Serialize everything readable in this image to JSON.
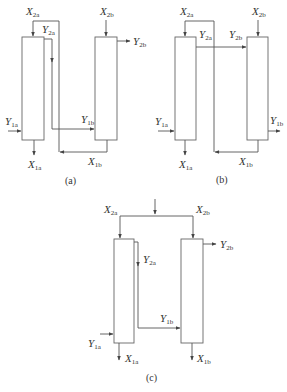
{
  "diagrams": {
    "a": {
      "caption": "(a)",
      "labels": {
        "x2a": {
          "main": "X",
          "sub": "2a"
        },
        "x2b": {
          "main": "X",
          "sub": "2b"
        },
        "y2a": {
          "main": "Y",
          "sub": "2a"
        },
        "y2b": {
          "main": "Y",
          "sub": "2b"
        },
        "y1a": {
          "main": "Y",
          "sub": "1a"
        },
        "y1b": {
          "main": "Y",
          "sub": "1b"
        },
        "x1a": {
          "main": "X",
          "sub": "1a"
        },
        "x1b": {
          "main": "X",
          "sub": "1b"
        }
      }
    },
    "b": {
      "caption": "(b)",
      "labels": {
        "x2a": {
          "main": "X",
          "sub": "2a"
        },
        "x2b": {
          "main": "X",
          "sub": "2b"
        },
        "y2a": {
          "main": "Y",
          "sub": "2a"
        },
        "y2b": {
          "main": "Y",
          "sub": "2b"
        },
        "y1a": {
          "main": "Y",
          "sub": "1a"
        },
        "y1b": {
          "main": "Y",
          "sub": "1b"
        },
        "x1a": {
          "main": "X",
          "sub": "1a"
        },
        "x1b": {
          "main": "X",
          "sub": "1b"
        }
      }
    },
    "c": {
      "caption": "(c)",
      "labels": {
        "x2a": {
          "main": "X",
          "sub": "2a"
        },
        "x2b": {
          "main": "X",
          "sub": "2b"
        },
        "y2a": {
          "main": "Y",
          "sub": "2a"
        },
        "y2b": {
          "main": "Y",
          "sub": "2b"
        },
        "y1a": {
          "main": "Y",
          "sub": "1a"
        },
        "y1b": {
          "main": "Y",
          "sub": "1b"
        },
        "x1a": {
          "main": "X",
          "sub": "1a"
        },
        "x1b": {
          "main": "X",
          "sub": "1b"
        }
      }
    }
  }
}
